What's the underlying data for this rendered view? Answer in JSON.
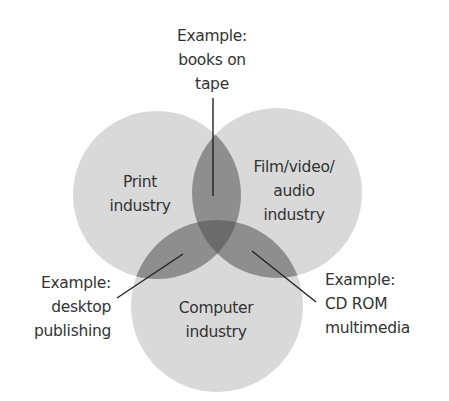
{
  "diagram": {
    "type": "venn",
    "colors": {
      "background": "#ffffff",
      "circle_fill": "#d9d9d9",
      "pair_overlap": "#8e8e8e",
      "triple_overlap": "#6b6b6b",
      "line": "#222222",
      "text": "#333333"
    },
    "sets": [
      {
        "id": "print",
        "lines": [
          "Print",
          "industry"
        ],
        "cx": 157,
        "cy": 195,
        "r": 84
      },
      {
        "id": "film",
        "lines": [
          "Film/video/",
          "audio",
          "industry"
        ],
        "cx": 277,
        "cy": 193,
        "r": 85
      },
      {
        "id": "computer",
        "lines": [
          "Computer",
          "industry"
        ],
        "cx": 217,
        "cy": 306,
        "r": 86
      }
    ],
    "callouts": [
      {
        "id": "books-on-tape",
        "between": [
          "print",
          "film"
        ],
        "lines": [
          "Example:",
          "books on",
          "tape"
        ]
      },
      {
        "id": "desktop-publishing",
        "between": [
          "print",
          "computer"
        ],
        "lines": [
          "Example:",
          "desktop",
          "publishing"
        ]
      },
      {
        "id": "cd-rom-multimedia",
        "between": [
          "film",
          "computer"
        ],
        "lines": [
          "Example:",
          "CD ROM",
          "multimedia"
        ]
      }
    ]
  }
}
